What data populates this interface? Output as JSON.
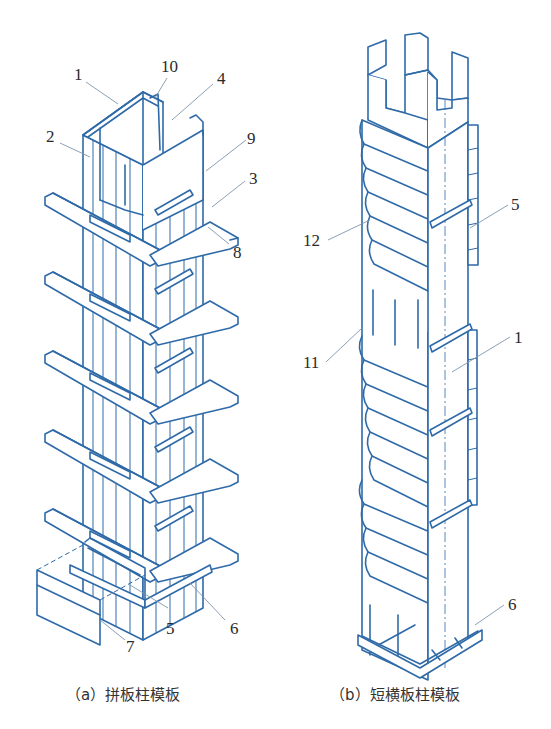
{
  "figure": {
    "line_color": "#2f6aa8",
    "fill_color": "#eef4fb",
    "leader_color": "#6f8fb0",
    "panels": [
      {
        "id": "a",
        "caption": "（a）拼板柱模板",
        "callouts": [
          "1",
          "10",
          "4",
          "2",
          "9",
          "3",
          "8",
          "5",
          "6",
          "7"
        ]
      },
      {
        "id": "b",
        "caption": "（b）短横板柱模板",
        "callouts": [
          "12",
          "5",
          "11",
          "1",
          "6"
        ]
      }
    ]
  },
  "labels_a": {
    "n1": "1",
    "n10": "10",
    "n4": "4",
    "n2": "2",
    "n9": "9",
    "n3": "3",
    "n8": "8",
    "n5": "5",
    "n6": "6",
    "n7": "7"
  },
  "labels_b": {
    "n12": "12",
    "n5": "5",
    "n11": "11",
    "n1": "1",
    "n6": "6"
  },
  "captions": {
    "a": "（a）拼板柱模板",
    "b": "（b）短横板柱模板"
  }
}
